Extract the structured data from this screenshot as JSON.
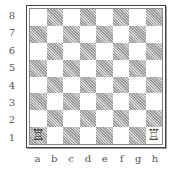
{
  "board": {
    "ranks": [
      "8",
      "7",
      "6",
      "5",
      "4",
      "3",
      "2",
      "1"
    ],
    "files": [
      "a",
      "b",
      "c",
      "d",
      "e",
      "f",
      "g",
      "h"
    ],
    "pieces": [
      {
        "square": "a1",
        "piece": "white-rook",
        "glyph": "♖"
      },
      {
        "square": "h1",
        "piece": "white-rook",
        "glyph": "♖"
      }
    ],
    "colors": {
      "dark_square": "#bdbdbd",
      "light_square": "#ffffff",
      "border": "#444444"
    }
  }
}
